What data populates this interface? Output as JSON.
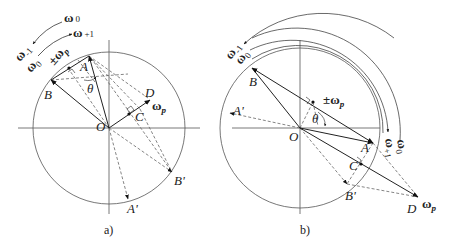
{
  "panels": [
    {
      "caption": "a)",
      "points": {
        "O": "O",
        "A": "A",
        "B": "B",
        "C": "C",
        "D": "D",
        "A_prime": "A'",
        "B_prime": "B'"
      },
      "angle_label": "θ",
      "vectors": {
        "omega_p": "ω",
        "omega_p_sub": "p",
        "pm_omega_p": "±ω",
        "pm_omega_p_sub": "p"
      },
      "arc_labels": {
        "omega_0_top": "ω",
        "omega_0_top_sub": "0",
        "omega_plus1": "ω",
        "omega_plus1_sub": "+1",
        "omega_minus1": "ω",
        "omega_minus1_sub": "-1",
        "omega_0_left": "ω",
        "omega_0_left_sub": "0"
      }
    },
    {
      "caption": "b)",
      "points": {
        "O": "O",
        "A": "A",
        "B": "B",
        "C": "C",
        "D": "D",
        "A_prime": "A'",
        "B_prime": "B'"
      },
      "angle_label": "θ",
      "vectors": {
        "omega_p": "ω",
        "omega_p_sub": "p",
        "pm_omega_p": "±ω",
        "pm_omega_p_sub": "p"
      },
      "arc_labels": {
        "omega_minus1": "ω",
        "omega_minus1_sub": "-1",
        "omega_0_top": "ω",
        "omega_0_top_sub": "0",
        "omega_plus1": "ω",
        "omega_plus1_sub": "+1",
        "omega_0_right": "ω",
        "omega_0_right_sub": "0"
      }
    }
  ]
}
